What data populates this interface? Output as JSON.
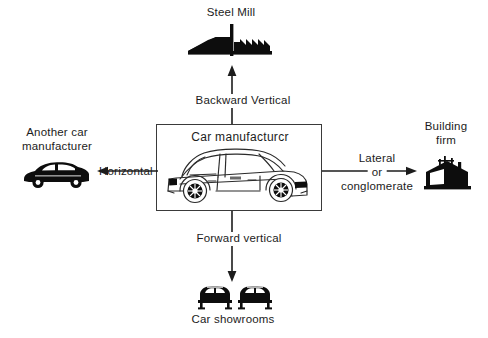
{
  "diagram": {
    "title_text": "Car manufacturcr",
    "center": {
      "label": "Car manufacturcr",
      "icon": "car-side-outline-icon"
    },
    "nodes": [
      {
        "id": "steel-mill",
        "label": "Steel Mill",
        "icon": "factory-icon",
        "position": "top"
      },
      {
        "id": "another-car-manufacturer",
        "label": "Another car\nmanufacturer",
        "label_line1": "Another car",
        "label_line2": "manufacturer",
        "icon": "car-side-silhouette-icon",
        "position": "left"
      },
      {
        "id": "building-firm",
        "label": "Building\nfirm",
        "label_line1": "Building",
        "label_line2": "firm",
        "icon": "house-construction-icon",
        "position": "right"
      },
      {
        "id": "car-showrooms",
        "label": "Car showrooms",
        "icon": "two-cars-front-icon",
        "position": "bottom"
      }
    ],
    "connectors": [
      {
        "id": "backward-vertical",
        "label": "Backward Vertical",
        "from": "car-manufacturer",
        "to": "steel-mill",
        "direction": "up"
      },
      {
        "id": "horizontal",
        "label": "Horizontal",
        "from": "car-manufacturer",
        "to": "another-car-manufacturer",
        "direction": "left"
      },
      {
        "id": "lateral-or-conglomerate",
        "label": "Lateral\nor\nconglomerate",
        "label_line1": "Lateral",
        "label_line2": "or",
        "label_line3": "conglomerate",
        "from": "car-manufacturer",
        "to": "building-firm",
        "direction": "right"
      },
      {
        "id": "forward-vertical",
        "label": "Forward vertical",
        "from": "car-manufacturer",
        "to": "car-showrooms",
        "direction": "down"
      }
    ],
    "colors": {
      "ink": "#1c1c1c",
      "line": "#3a3a3a",
      "silhouette": "#0d0d0d",
      "background": "#ffffff"
    }
  }
}
